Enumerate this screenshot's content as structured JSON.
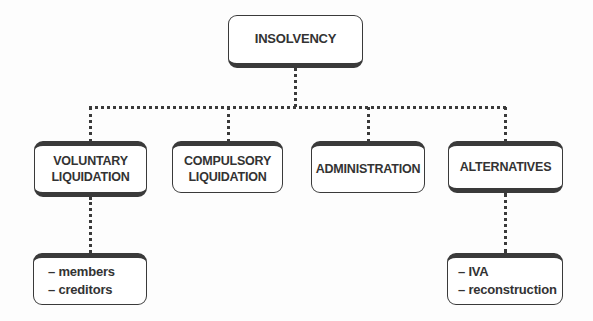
{
  "diagram": {
    "type": "hierarchy",
    "root": {
      "label": "INSOLVENCY"
    },
    "children": [
      {
        "label": "VOLUNTARY\nLIQUIDATION",
        "sub_items": [
          "– members",
          "– creditors"
        ]
      },
      {
        "label": "COMPULSORY\nLIQUIDATION"
      },
      {
        "label": "ADMINISTRATION"
      },
      {
        "label": "ALTERNATIVES",
        "sub_items": [
          "– IVA",
          "– reconstruction"
        ]
      }
    ],
    "colors": {
      "border": "#3a3a3a",
      "text": "#333333",
      "background": "#ffffff"
    }
  }
}
